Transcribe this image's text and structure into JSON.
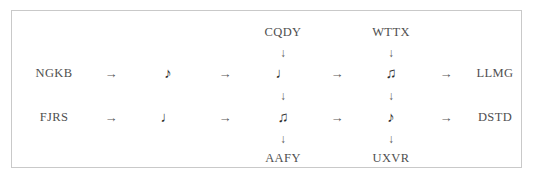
{
  "diagram": {
    "type": "flow-grid",
    "border_color": "#c9c9c9",
    "background_color": "#ffffff",
    "text_color": "#4f4f4f",
    "glyphs": {
      "arrow_right": "→",
      "arrow_down": "↓",
      "eighth_note": "♪",
      "quarter_note": "♩",
      "beamed_notes": "♫"
    },
    "top_labels": [
      {
        "text": "CQDY",
        "column": 3
      },
      {
        "text": "WTTX",
        "column": 4
      }
    ],
    "bottom_labels": [
      {
        "text": "AAFY",
        "column": 3
      },
      {
        "text": "UXVR",
        "column": 4
      }
    ],
    "rows": [
      {
        "start_label": "NGKB",
        "end_label": "LLMG",
        "notes": [
          "♪",
          "♩",
          "♫"
        ]
      },
      {
        "start_label": "FJRS",
        "end_label": "DSTD",
        "notes": [
          "♩",
          "♫",
          "♪"
        ]
      }
    ],
    "horizontal_arrows": [
      "→",
      "→",
      "→",
      "→"
    ],
    "vertical_arrows": [
      "↓",
      "↓",
      "↓",
      "↓"
    ]
  }
}
